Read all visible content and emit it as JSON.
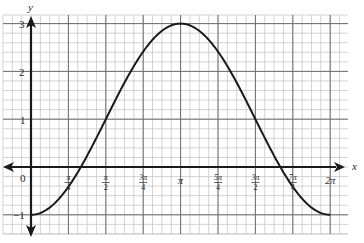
{
  "chart_data": {
    "type": "line",
    "title": "",
    "xlabel": "x",
    "ylabel": "y",
    "function": "y = 1 - 2cos(x)",
    "xlim": [
      0,
      6.2832
    ],
    "ylim": [
      -1,
      3
    ],
    "grid": true,
    "x_ticks": [
      {
        "label": "0",
        "value": 0
      },
      {
        "label": "π/4",
        "value": 0.7854
      },
      {
        "label": "π/2",
        "value": 1.5708
      },
      {
        "label": "3π/4",
        "value": 2.3562
      },
      {
        "label": "π",
        "value": 3.1416
      },
      {
        "label": "5π/4",
        "value": 3.927
      },
      {
        "label": "3π/2",
        "value": 4.7124
      },
      {
        "label": "7π/4",
        "value": 5.4978
      },
      {
        "label": "2π",
        "value": 6.2832
      }
    ],
    "y_ticks": [
      {
        "label": "3",
        "value": 3
      },
      {
        "label": "2",
        "value": 2
      },
      {
        "label": "1",
        "value": 1
      },
      {
        "label": "0",
        "value": 0
      },
      {
        "label": "-1",
        "value": -1
      }
    ],
    "series": [
      {
        "name": "curve",
        "x": [
          0,
          0.7854,
          1.5708,
          2.3562,
          3.1416,
          3.927,
          4.7124,
          5.4978,
          6.2832
        ],
        "values": [
          -1,
          -0.414,
          1,
          2.414,
          3,
          2.414,
          1,
          -0.414,
          -1
        ]
      }
    ]
  },
  "labels": {
    "x_axis": "x",
    "y_axis": "y",
    "origin": "0",
    "y3": "3",
    "y2": "2",
    "y1": "1",
    "yneg1": "−1"
  },
  "colors": {
    "grid_minor": "#c8c8c8",
    "grid_major": "#6e6e6e",
    "axis": "#1a1a1a",
    "curve": "#1a1a1a"
  }
}
